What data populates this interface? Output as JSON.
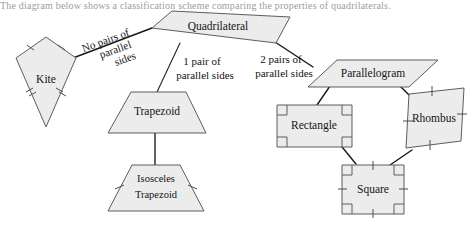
{
  "caption": {
    "text": "The diagram below shows a classification scheme comparing the properties of quadrilaterals."
  },
  "diagram": {
    "fill_color": "#ececec",
    "stroke_color": "#5d5d5d",
    "connector_color": "#16161a",
    "background_color": "#ffffff",
    "nodes": [
      {
        "id": "quadrilateral",
        "label": "Quadrilateral",
        "shape": "irregular-quadrilateral",
        "marks": "none"
      },
      {
        "id": "kite",
        "label": "Kite",
        "shape": "kite",
        "marks": "two pairs of adjacent congruent sides (single and double ticks)"
      },
      {
        "id": "trapezoid",
        "label": "Trapezoid",
        "shape": "trapezoid",
        "marks": "none"
      },
      {
        "id": "isosceles-trapezoid",
        "label_line_1": "Isosceles",
        "label_line_2": "Trapezoid",
        "shape": "isosceles-trapezoid",
        "marks": "congruent legs (single ticks)"
      },
      {
        "id": "parallelogram",
        "label": "Parallelogram",
        "shape": "parallelogram",
        "marks": "none"
      },
      {
        "id": "rectangle",
        "label": "Rectangle",
        "shape": "rectangle",
        "marks": "four right angles"
      },
      {
        "id": "rhombus",
        "label": "Rhombus",
        "shape": "rhombus",
        "marks": "four congruent sides (single ticks)"
      },
      {
        "id": "square",
        "label": "Square",
        "shape": "square",
        "marks": "four right angles and four congruent sides"
      }
    ],
    "edges": [
      {
        "from": "quadrilateral",
        "to": "kite",
        "label_line_1": "No pairs of",
        "label_line_2": "parallel",
        "label_line_3": "sides",
        "label_rotated": true
      },
      {
        "from": "quadrilateral",
        "to": "trapezoid",
        "label_line_1": "1 pair of",
        "label_line_2": "parallel sides",
        "label_rotated": false
      },
      {
        "from": "quadrilateral",
        "to": "parallelogram",
        "label_line_1": "2 pairs of",
        "label_line_2": "parallel sides",
        "label_rotated": false
      },
      {
        "from": "trapezoid",
        "to": "isosceles-trapezoid",
        "label_line_1": "",
        "label_line_2": "",
        "label_rotated": false
      },
      {
        "from": "parallelogram",
        "to": "rectangle",
        "label_line_1": "",
        "label_line_2": "",
        "label_rotated": false
      },
      {
        "from": "parallelogram",
        "to": "rhombus",
        "label_line_1": "",
        "label_line_2": "",
        "label_rotated": false
      },
      {
        "from": "rectangle",
        "to": "square",
        "label_line_1": "",
        "label_line_2": "",
        "label_rotated": false
      },
      {
        "from": "rhombus",
        "to": "square",
        "label_line_1": "",
        "label_line_2": "",
        "label_rotated": false
      }
    ]
  }
}
